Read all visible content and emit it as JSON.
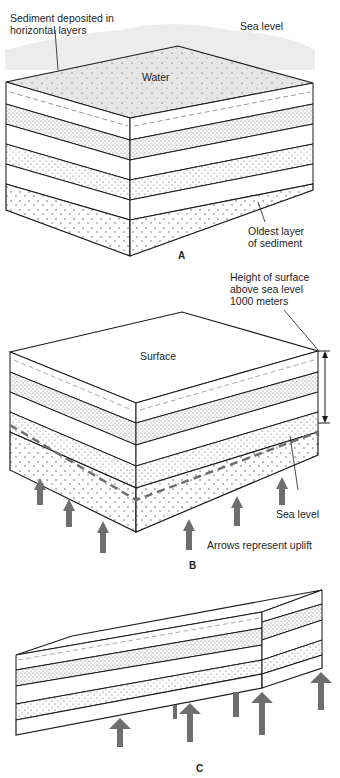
{
  "panel_a": {
    "letter": "A",
    "labels": {
      "sediment_line1": "Sediment deposited in",
      "sediment_line2": "horizontal layers",
      "sea_level": "Sea level",
      "water": "Water",
      "oldest_line1": "Oldest layer",
      "oldest_line2": "of sediment"
    }
  },
  "panel_b": {
    "letter": "B",
    "labels": {
      "height_line1": "Height of surface",
      "height_line2": "above sea level",
      "height_line3": "1000 meters",
      "surface": "Surface",
      "sea_level": "Sea level",
      "arrows": "Arrows represent uplift"
    }
  },
  "panel_c": {
    "letter": "C"
  },
  "colors": {
    "line": "#1a1a1a",
    "arrow": "#6e6e6e",
    "water": "#d9d9d9",
    "dense_stipple": "#9a9a9a"
  }
}
